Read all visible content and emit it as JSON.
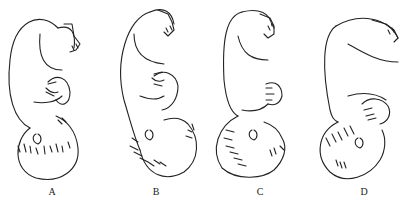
{
  "diagram": {
    "type": "illustration",
    "figures": [
      {
        "id": "A",
        "label": "A",
        "head_position": "down, face toward back"
      },
      {
        "id": "B",
        "label": "B",
        "head_position": "down, face tilted right"
      },
      {
        "id": "C",
        "label": "C",
        "head_position": "down, face right (profile)"
      },
      {
        "id": "D",
        "label": "D",
        "head_position": "down, face toward front"
      }
    ],
    "colors": {
      "line": "#222222",
      "background": "#ffffff"
    }
  }
}
